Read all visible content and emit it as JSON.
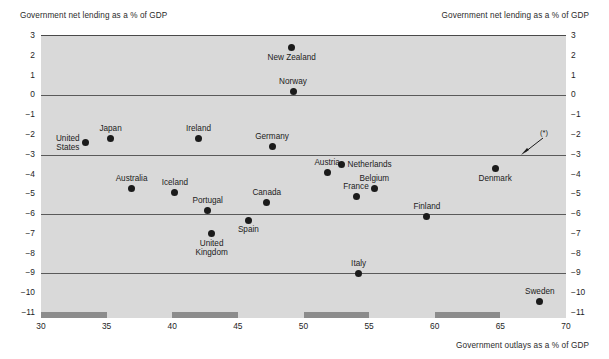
{
  "captions": {
    "top_left": "Government net lending as a % of GDP",
    "top_right": "Government net lending as a % of GDP",
    "bottom_right": "Government outlays as a % of GDP"
  },
  "footnote_marker": "(*)",
  "colors": {
    "plot_background": "#d9d9d9",
    "gridline": "#5a5a5a",
    "point": "#1b1b1b",
    "axis_band": "#8c8c8c",
    "page_background": "#ffffff",
    "text": "#1c1c1c"
  },
  "chart_data": {
    "type": "scatter",
    "title": "",
    "xlabel": "Government outlays as a % of GDP",
    "ylabel": "Government net lending as a % of GDP",
    "xlim": [
      30,
      70
    ],
    "ylim": [
      -11,
      3
    ],
    "xticks": [
      30,
      35,
      40,
      45,
      50,
      55,
      60,
      65,
      70
    ],
    "yticks": [
      3,
      2,
      1,
      0,
      -1,
      -2,
      -3,
      -4,
      -5,
      -6,
      -7,
      -8,
      -9,
      -10,
      -11
    ],
    "ytick_labels": [
      "3",
      "2",
      "1",
      "0",
      "−1",
      "−2",
      "−3",
      "−4",
      "−5",
      "−6",
      "−7",
      "−8",
      "−9",
      "−10",
      "−11"
    ],
    "gridlines_y": [
      3,
      0,
      -3,
      -6,
      -9
    ],
    "grid": true,
    "legend": "none",
    "axis_band_segments": [
      [
        30,
        35
      ],
      [
        40,
        45
      ],
      [
        50,
        55
      ],
      [
        60,
        65
      ]
    ],
    "points": [
      {
        "label": "United States",
        "x": 33.4,
        "y": -2.4,
        "label_pos": "left",
        "label_lines": [
          "United",
          "States"
        ]
      },
      {
        "label": "Japan",
        "x": 35.3,
        "y": -2.2,
        "label_pos": "above",
        "label_lines": [
          "Japan"
        ]
      },
      {
        "label": "Australia",
        "x": 36.9,
        "y": -4.7,
        "label_pos": "above",
        "label_lines": [
          "Australia"
        ]
      },
      {
        "label": "Iceland",
        "x": 40.2,
        "y": -4.9,
        "label_pos": "above",
        "label_lines": [
          "Iceland"
        ]
      },
      {
        "label": "Ireland",
        "x": 42.0,
        "y": -2.2,
        "label_pos": "above",
        "label_lines": [
          "Ireland"
        ]
      },
      {
        "label": "Portugal",
        "x": 42.7,
        "y": -5.8,
        "label_pos": "above",
        "label_lines": [
          "Portugal"
        ]
      },
      {
        "label": "United Kingdom",
        "x": 43.0,
        "y": -7.0,
        "label_pos": "below",
        "label_lines": [
          "United",
          "Kingdom"
        ]
      },
      {
        "label": "Spain",
        "x": 45.8,
        "y": -6.3,
        "label_pos": "below",
        "label_lines": [
          "Spain"
        ]
      },
      {
        "label": "Canada",
        "x": 47.2,
        "y": -5.4,
        "label_pos": "above",
        "label_lines": [
          "Canada"
        ]
      },
      {
        "label": "Germany",
        "x": 47.6,
        "y": -2.6,
        "label_pos": "above",
        "label_lines": [
          "Germany"
        ]
      },
      {
        "label": "New Zealand",
        "x": 49.1,
        "y": 2.4,
        "label_pos": "below",
        "label_lines": [
          "New Zealand"
        ]
      },
      {
        "label": "Norway",
        "x": 49.2,
        "y": 0.2,
        "label_pos": "above",
        "label_lines": [
          "Norway"
        ]
      },
      {
        "label": "Austria",
        "x": 51.8,
        "y": -3.9,
        "label_pos": "above",
        "label_lines": [
          "Austria"
        ]
      },
      {
        "label": "Netherlands",
        "x": 52.9,
        "y": -3.5,
        "label_pos": "right",
        "label_lines": [
          "Netherlands"
        ]
      },
      {
        "label": "France",
        "x": 54.0,
        "y": -5.1,
        "label_pos": "above",
        "label_lines": [
          "France"
        ]
      },
      {
        "label": "Italy",
        "x": 54.2,
        "y": -9.0,
        "label_pos": "above",
        "label_lines": [
          "Italy"
        ]
      },
      {
        "label": "Belgium",
        "x": 55.4,
        "y": -4.7,
        "label_pos": "above",
        "label_lines": [
          "Belgium"
        ]
      },
      {
        "label": "Finland",
        "x": 59.4,
        "y": -6.1,
        "label_pos": "above",
        "label_lines": [
          "Finland"
        ]
      },
      {
        "label": "Denmark",
        "x": 64.6,
        "y": -3.7,
        "label_pos": "below",
        "label_lines": [
          "Denmark"
        ]
      },
      {
        "label": "Sweden",
        "x": 68.0,
        "y": -10.4,
        "label_pos": "above",
        "label_lines": [
          "Sweden"
        ]
      }
    ]
  }
}
